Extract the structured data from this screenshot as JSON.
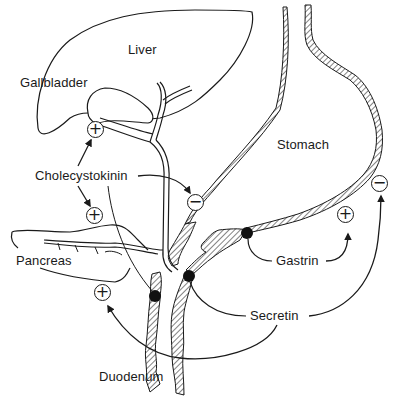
{
  "diagram": {
    "organs": [
      {
        "id": "liver",
        "label": "Liver"
      },
      {
        "id": "gallbladder",
        "label": "Gallbladder"
      },
      {
        "id": "pancreas",
        "label": "Pancreas"
      },
      {
        "id": "stomach",
        "label": "Stomach"
      },
      {
        "id": "duodenum",
        "label": "Duodenum"
      }
    ],
    "hormones": [
      {
        "id": "cholecystokinin",
        "label": "Cholecystokinin"
      },
      {
        "id": "gastrin",
        "label": "Gastrin"
      },
      {
        "id": "secretin",
        "label": "Secretin"
      }
    ],
    "effects": [
      {
        "from": "Cholecystokinin",
        "to": "Gallbladder",
        "sign": "+"
      },
      {
        "from": "Cholecystokinin",
        "to": "Pancreas",
        "sign": "+"
      },
      {
        "from": "Cholecystokinin",
        "to": "Stomach",
        "sign": "−"
      },
      {
        "from": "Gastrin",
        "to": "Stomach",
        "sign": "+"
      },
      {
        "from": "Secretin",
        "to": "Stomach",
        "sign": "−"
      },
      {
        "from": "Secretin",
        "to": "Pancreas",
        "sign": "+"
      }
    ],
    "signs": {
      "plus": "+",
      "minus": "−"
    },
    "colors": {
      "line": "#1a1a1a",
      "background": "#ffffff",
      "dot": "#111111"
    }
  }
}
